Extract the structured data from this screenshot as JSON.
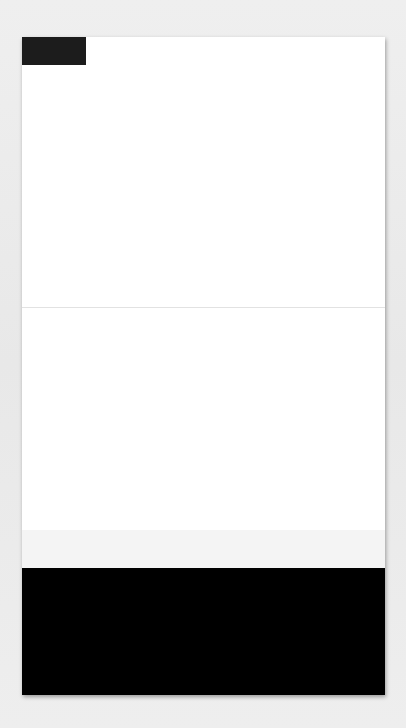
{
  "badge": {
    "label": "Step 4",
    "background": "#1c1c1c",
    "text_color": "#ffffff"
  },
  "panels": {
    "top": {
      "description": "Six large black dots scattered on white",
      "dots": [
        {
          "x": 54,
          "y": 58,
          "r": 35
        },
        {
          "x": 177,
          "y": 103,
          "r": 39
        },
        {
          "x": 303,
          "y": 60,
          "r": 36
        },
        {
          "x": 57,
          "y": 177,
          "r": 37
        },
        {
          "x": 170,
          "y": 216,
          "r": 36
        },
        {
          "x": 303,
          "y": 184,
          "r": 36
        }
      ]
    },
    "middle": {
      "description": "Two black dots above an arc of small black ovals",
      "dots": [
        {
          "x": 166,
          "y": 61,
          "r": 22
        },
        {
          "x": 291,
          "y": 49,
          "r": 20
        }
      ],
      "ovals": [
        {
          "x": 13,
          "y": 87,
          "w": 9,
          "h": 22,
          "rot": 45
        },
        {
          "x": 60,
          "y": 133,
          "w": 10,
          "h": 22,
          "rot": 40
        },
        {
          "x": 111,
          "y": 173,
          "w": 11,
          "h": 27,
          "rot": 20
        },
        {
          "x": 175,
          "y": 191,
          "w": 17,
          "h": 32,
          "rot": 5
        },
        {
          "x": 240,
          "y": 185,
          "w": 14,
          "h": 31,
          "rot": -20
        },
        {
          "x": 294,
          "y": 156,
          "w": 12,
          "h": 24,
          "rot": -35
        },
        {
          "x": 329,
          "y": 111,
          "w": 20,
          "h": 18,
          "rot": -30
        }
      ]
    },
    "bottom": {
      "description": "Scalloped row of white circles over a black ground",
      "background": "#000000",
      "circles": [
        {
          "x": 40,
          "y": 10,
          "r": 33
        },
        {
          "x": 75,
          "y": 60,
          "r": 32
        },
        {
          "x": 112,
          "y": 95,
          "r": 32
        },
        {
          "x": 170,
          "y": 110,
          "r": 34
        },
        {
          "x": 232,
          "y": 95,
          "r": 33
        },
        {
          "x": 288,
          "y": 70,
          "r": 32
        },
        {
          "x": 332,
          "y": 22,
          "r": 32
        }
      ]
    }
  }
}
